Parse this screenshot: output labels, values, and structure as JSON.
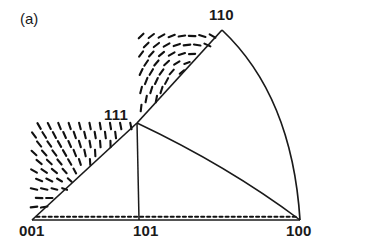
{
  "figure": {
    "panel_label": "(a)",
    "type": "stereographic-triangle-director-field",
    "background_color": "#ffffff",
    "line_color": "#1a1a1a",
    "dash_color": "#111111"
  },
  "vertices": [
    {
      "id": "110",
      "label": "110",
      "x": 222,
      "y": 30
    },
    {
      "id": "111",
      "label": "111",
      "x": 137,
      "y": 123
    },
    {
      "id": "001",
      "label": "001",
      "x": 32,
      "y": 220
    },
    {
      "id": "101",
      "label": "101",
      "x": 139,
      "y": 220
    },
    {
      "id": "100",
      "label": "100",
      "x": 300,
      "y": 220
    }
  ],
  "boundaries": [
    {
      "name": "edge-001-111",
      "kind": "straight",
      "from": "001",
      "to": "111"
    },
    {
      "name": "edge-111-110",
      "kind": "straight",
      "from": "111",
      "to": "110"
    },
    {
      "name": "arc-110-100",
      "kind": "curved",
      "from": "110",
      "to": "100"
    },
    {
      "name": "edge-001-100-baseline",
      "kind": "straight",
      "from": "001",
      "to": "100"
    },
    {
      "name": "arc-111-100",
      "kind": "curved",
      "from": "111",
      "to": "100"
    },
    {
      "name": "edge-111-101",
      "kind": "straight",
      "from": "111",
      "to": "101"
    }
  ],
  "chart_data": {
    "type": "scatter",
    "title": "",
    "subtitle": "",
    "xlabel": "",
    "ylabel": "",
    "grid": false,
    "legend": null,
    "annotations": [
      "(a)",
      "110",
      "111",
      "001",
      "101",
      "100"
    ],
    "field_dash_count": 430,
    "field_sources": [
      {
        "name": "focus-lower-left",
        "x": 86,
        "y": 196,
        "type": "convergent"
      },
      {
        "name": "focus-lower-right",
        "x": 214,
        "y": 193,
        "type": "swirl"
      },
      {
        "name": "focus-upper",
        "x": 205,
        "y": 86,
        "type": "swirl"
      },
      {
        "name": "saddle-right",
        "x": 272,
        "y": 150,
        "type": "saddle"
      }
    ]
  }
}
